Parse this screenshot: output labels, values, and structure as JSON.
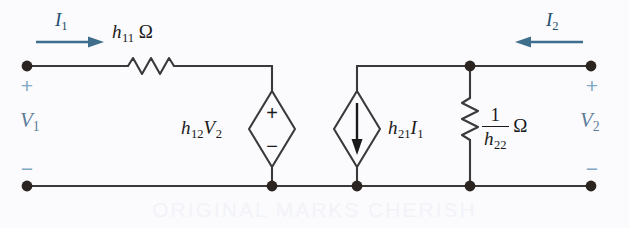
{
  "figure": {
    "background_color": "#fbfbfd",
    "wire_color": "#3a3a3a",
    "label_color": "#1a1a1a",
    "terminal_label_color": "#5f7f99",
    "sign_color": "#7fa8c4",
    "current_label_color": "#24506d",
    "watermark_text": "ORIGINAL MARKS CHERISH"
  },
  "currents": {
    "input": {
      "symbol": "I",
      "subscript": "1",
      "direction": "right"
    },
    "output": {
      "symbol": "I",
      "subscript": "2",
      "direction": "left"
    }
  },
  "ports": {
    "input": {
      "voltage_symbol": "V",
      "voltage_subscript": "1",
      "plus": "+",
      "minus": "−"
    },
    "output": {
      "voltage_symbol": "V",
      "voltage_subscript": "2",
      "plus": "+",
      "minus": "−"
    }
  },
  "components": {
    "series_resistor": {
      "name": "series-resistor",
      "symbol": "h",
      "subscript": "11",
      "unit": "Ω",
      "orientation": "horizontal"
    },
    "dependent_voltage_source": {
      "name": "dependent-voltage-source",
      "symbol": "h",
      "subscript": "12",
      "controlling_symbol": "V",
      "controlling_subscript": "2",
      "plus": "+",
      "minus": "−",
      "shape": "diamond"
    },
    "dependent_current_source": {
      "name": "dependent-current-source",
      "symbol": "h",
      "subscript": "21",
      "controlling_symbol": "I",
      "controlling_subscript": "1",
      "arrow_direction": "down",
      "shape": "diamond"
    },
    "shunt_resistor": {
      "name": "shunt-resistor",
      "numerator": "1",
      "denominator_symbol": "h",
      "denominator_subscript": "22",
      "unit": "Ω",
      "orientation": "vertical"
    }
  }
}
